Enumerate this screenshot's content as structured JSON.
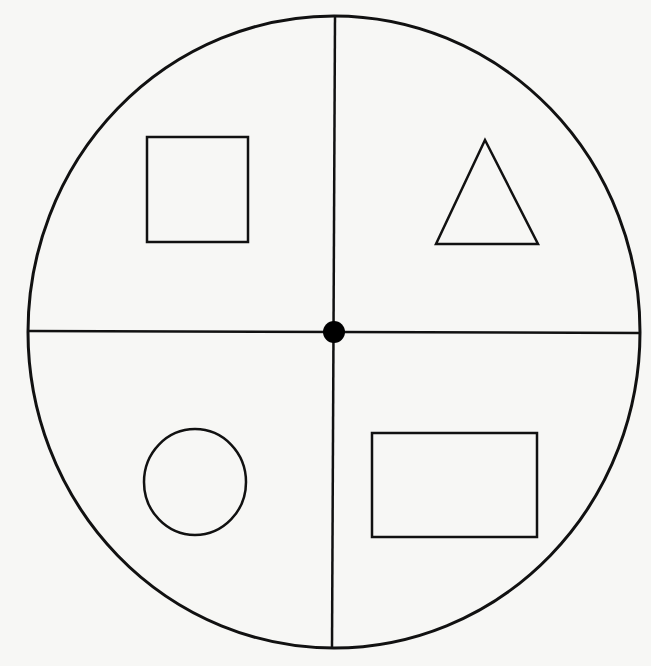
{
  "diagram": {
    "title": "",
    "background": "#f7f7f5",
    "stroke": "#111111",
    "outer_circle": {
      "cx": 334,
      "cy": 332,
      "rx": 306,
      "ry": 316
    },
    "center_dot": {
      "cx": 334,
      "cy": 332,
      "r": 11
    },
    "horizontal_line": {
      "x1": 28,
      "y1": 331,
      "x2": 640,
      "y2": 333
    },
    "vertical_line": {
      "x1": 335,
      "y1": 16,
      "x2": 332,
      "y2": 648
    },
    "quadrants": [
      {
        "position": "top-left",
        "shape": "square",
        "x": 147,
        "y": 137,
        "w": 101,
        "h": 105
      },
      {
        "position": "top-right",
        "shape": "triangle",
        "points": "485,140 436,244 538,244"
      },
      {
        "position": "bottom-left",
        "shape": "circle",
        "cx": 195,
        "cy": 482,
        "rx": 51,
        "ry": 53
      },
      {
        "position": "bottom-right",
        "shape": "rectangle",
        "x": 372,
        "y": 433,
        "w": 165,
        "h": 104
      }
    ]
  }
}
